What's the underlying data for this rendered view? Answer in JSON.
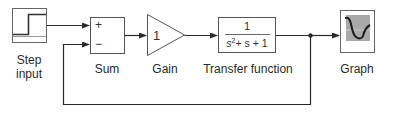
{
  "diagram": {
    "title": "",
    "blocks": [
      {
        "id": "step",
        "label_line1": "Step",
        "label_line2": "input"
      },
      {
        "id": "sum",
        "label": "Sum",
        "plus": "+",
        "minus": "−"
      },
      {
        "id": "gain",
        "label": "Gain",
        "value": "1"
      },
      {
        "id": "tf",
        "label": "Transfer function",
        "numerator": "1",
        "denominator_s": "s",
        "denominator_exp": "2",
        "denominator_rest": "+ s + 1"
      },
      {
        "id": "graph",
        "label": "Graph"
      }
    ],
    "connections": [
      {
        "from": "step",
        "to": "sum.plus"
      },
      {
        "from": "sum",
        "to": "gain"
      },
      {
        "from": "gain",
        "to": "tf"
      },
      {
        "from": "tf",
        "to": "graph"
      },
      {
        "from": "tf",
        "to": "sum.minus",
        "type": "feedback"
      }
    ]
  },
  "colors": {
    "line": "#2a2a2a",
    "block_border": "#555555",
    "graph_bg": "#a9a9a9"
  }
}
